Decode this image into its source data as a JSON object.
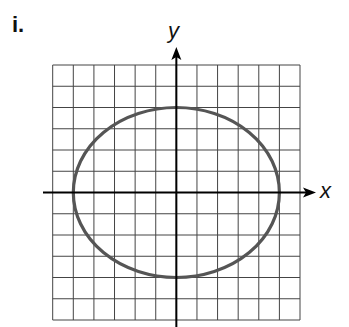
{
  "problem_label": "i.",
  "chart_data": {
    "type": "line",
    "title": "",
    "xlabel": "x",
    "ylabel": "y",
    "grid": true,
    "xlim": [
      -6,
      6
    ],
    "ylim": [
      -6,
      6
    ],
    "grid_step": 1,
    "tick_labels": false,
    "series": [
      {
        "name": "ellipse",
        "shape": "ellipse",
        "center": [
          0,
          0
        ],
        "semi_axis_x": 5,
        "semi_axis_y": 4,
        "vertices": [
          [
            -5,
            0
          ],
          [
            5,
            0
          ],
          [
            0,
            4
          ],
          [
            0,
            -4
          ]
        ],
        "equation": "x^2/25 + y^2/16 = 1",
        "color": "#555555"
      }
    ]
  },
  "colors": {
    "grid": "#444444",
    "axes": "#000000",
    "curve": "#555555"
  }
}
